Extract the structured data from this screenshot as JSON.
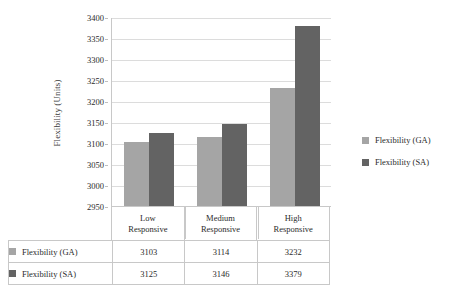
{
  "chart_data": {
    "type": "bar",
    "title": "",
    "xlabel": "",
    "ylabel": "Flexibility (Units)",
    "categories": [
      "Low\nResponsive",
      "Medium\nResponsive",
      "High\nResponsive"
    ],
    "category_lines": [
      [
        "Low",
        "Responsive"
      ],
      [
        "Medium",
        "Responsive"
      ],
      [
        "High",
        "Responsive"
      ]
    ],
    "series": [
      {
        "name": "Flexibility (GA)",
        "values": [
          3103,
          3114,
          3232
        ],
        "color": "#a5a5a5"
      },
      {
        "name": "Flexibility (SA)",
        "values": [
          3125,
          3146,
          3379
        ],
        "color": "#636363"
      }
    ],
    "ylim": [
      2950,
      3400
    ],
    "ytick_step": 50,
    "yticks": [
      2950,
      3000,
      3050,
      3100,
      3150,
      3200,
      3250,
      3300,
      3350,
      3400
    ],
    "ytick_labels": [
      "2950",
      "3000",
      "3050",
      "3100",
      "3150",
      "3200",
      "3250",
      "3300",
      "3350",
      "3400"
    ],
    "grid": true,
    "grid_axis": "y",
    "legend_position": "right",
    "legend_entries": [
      "Flexibility (GA)",
      "Flexibility (SA)"
    ],
    "data_table_visible": true
  },
  "table": {
    "column_headers": [
      "",
      "Low Responsive",
      "Medium Responsive",
      "High Responsive"
    ],
    "rows": [
      {
        "label": "Flexibility (GA)",
        "swatch_class": "swatch-ga",
        "cells": [
          "3103",
          "3114",
          "3232"
        ]
      },
      {
        "label": "Flexibility (SA)",
        "swatch_class": "swatch-sa",
        "cells": [
          "3125",
          "3146",
          "3379"
        ]
      }
    ]
  },
  "colors": {
    "series_ga": "#a5a5a5",
    "series_sa": "#636363",
    "gridline": "#dcdcdc",
    "axis": "#c8c8c8",
    "background": "#ffffff",
    "text": "#2b2b2b"
  }
}
